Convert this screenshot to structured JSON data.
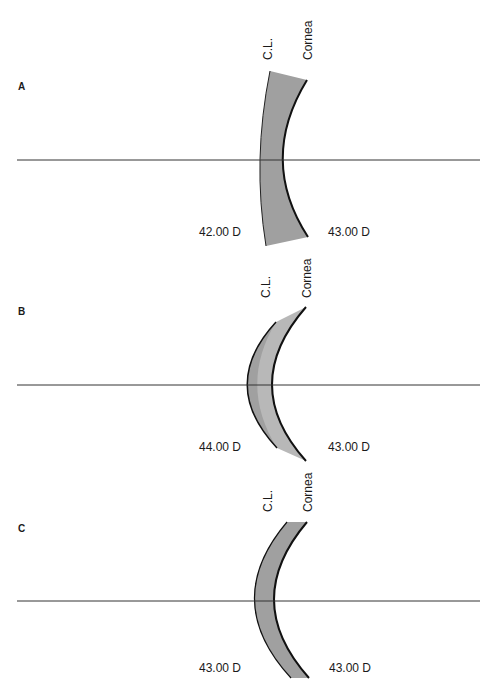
{
  "panels": [
    {
      "letter": "A",
      "cl_label": "C.L.",
      "cornea_label": "Cornea",
      "cl_power": "42.00 D",
      "cornea_power": "43.00 D"
    },
    {
      "letter": "B",
      "cl_label": "C.L.",
      "cornea_label": "Cornea",
      "cl_power": "44.00 D",
      "cornea_power": "43.00 D"
    },
    {
      "letter": "C",
      "cl_label": "C.L.",
      "cornea_label": "Cornea",
      "cl_power": "43.00 D",
      "cornea_power": "43.00 D"
    }
  ],
  "colors": {
    "lens_fill": "#a0a0a0",
    "lens_fill_light": "#b8b8b8",
    "stroke": "#111111",
    "axis": "#333333"
  }
}
